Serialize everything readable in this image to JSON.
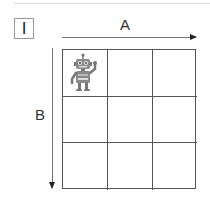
{
  "figure": {
    "label": "I",
    "axis_a": {
      "label": "A",
      "direction": "right"
    },
    "axis_b": {
      "label": "B",
      "direction": "down"
    },
    "grid": {
      "rows": 3,
      "cols": 3
    },
    "robot": {
      "row": 0,
      "col": 0,
      "icon": "robot-icon"
    }
  },
  "colors": {
    "grid": "#555555",
    "robot": "#808080",
    "arrow": "#777777"
  }
}
